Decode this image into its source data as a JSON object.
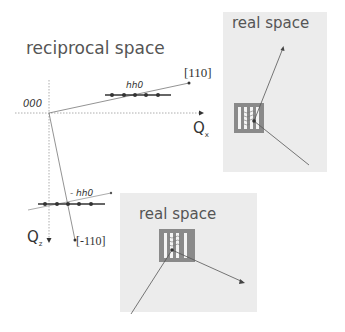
{
  "reciprocal": {
    "title": "reciprocal space",
    "origin_label": "000",
    "qx_label": "Q",
    "qx_sub": "x",
    "qz_label": "Q",
    "qz_sub": "z",
    "vector_110_label": "[110]",
    "vector_m110_label": "[-110]",
    "rod_hh0_label": "hh0",
    "rod_mhh0_label": "- hh0",
    "rod_hh0_dots": 5,
    "rod_mhh0_dots": 5
  },
  "real_space_top": {
    "title": "real space"
  },
  "real_space_bottom": {
    "title": "real space"
  },
  "colors": {
    "panel_bg": "#ececec",
    "grating_frame": "#8a8a8a",
    "line": "#666666",
    "dot": "#333333"
  }
}
